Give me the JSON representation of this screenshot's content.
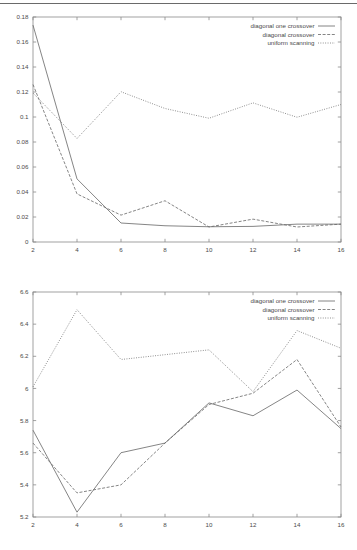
{
  "page": {
    "background_color": "#ffffff",
    "line_color": "#666666",
    "text_color": "#4a4a4a",
    "top_rule": true
  },
  "figures": [
    {
      "id": "top",
      "name": "convergence-error-chart"
    },
    {
      "id": "bottom",
      "name": "fitness-value-chart"
    }
  ],
  "chart_data": [
    {
      "type": "line",
      "title": "",
      "subtitle": "",
      "xlabel": "",
      "ylabel": "",
      "x": [
        2,
        4,
        6,
        8,
        10,
        12,
        14,
        16
      ],
      "xticks": [
        "2",
        "4",
        "6",
        "8",
        "10",
        "12",
        "14",
        "16"
      ],
      "yticks": [
        "0",
        "0.02",
        "0.04",
        "0.06",
        "0.08",
        "0.1",
        "0.12",
        "0.14",
        "0.16",
        "0.18"
      ],
      "xlim": [
        2,
        16
      ],
      "ylim": [
        0,
        0.18
      ],
      "grid": false,
      "legend_position": "top-right",
      "series": [
        {
          "name": "diagonal one crossover",
          "style": "solid",
          "values": [
            0.1735,
            0.0505,
            0.0152,
            0.013,
            0.0122,
            0.0125,
            0.0143,
            0.0143
          ]
        },
        {
          "name": "diagonal crossover",
          "style": "dashed",
          "values": [
            0.126,
            0.0385,
            0.0215,
            0.033,
            0.012,
            0.0183,
            0.012,
            0.0143
          ]
        },
        {
          "name": "uniform scanning",
          "style": "dotted",
          "values": [
            0.1192,
            0.0828,
            0.1202,
            0.1068,
            0.099,
            0.1113,
            0.0998,
            0.11
          ]
        }
      ]
    },
    {
      "type": "line",
      "title": "",
      "subtitle": "",
      "xlabel": "",
      "ylabel": "",
      "x": [
        2,
        4,
        6,
        8,
        10,
        12,
        14,
        16
      ],
      "xticks": [
        "2",
        "4",
        "6",
        "8",
        "10",
        "12",
        "14",
        "16"
      ],
      "yticks": [
        "5.2",
        "5.4",
        "5.6",
        "5.8",
        "6",
        "6.2",
        "6.4",
        "6.6"
      ],
      "xlim": [
        2,
        16
      ],
      "ylim": [
        5.2,
        6.6
      ],
      "grid": false,
      "legend_position": "top-right",
      "series": [
        {
          "name": "diagonal one crossover",
          "style": "solid",
          "values": [
            5.74,
            5.23,
            5.6,
            5.66,
            5.91,
            5.83,
            5.99,
            5.75
          ]
        },
        {
          "name": "diagonal crossover",
          "style": "dashed",
          "values": [
            5.66,
            5.35,
            5.4,
            5.66,
            5.9,
            5.97,
            6.18,
            5.76
          ]
        },
        {
          "name": "uniform scanning",
          "style": "dotted",
          "values": [
            6.01,
            6.49,
            6.18,
            6.21,
            6.24,
            5.98,
            6.36,
            6.25
          ]
        }
      ]
    }
  ],
  "legend": {
    "entries": [
      {
        "label": "diagonal one crossover",
        "style": "solid"
      },
      {
        "label": "diagonal crossover",
        "style": "dashed"
      },
      {
        "label": "uniform scanning",
        "style": "dotted"
      }
    ]
  }
}
